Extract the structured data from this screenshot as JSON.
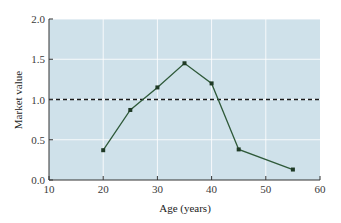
{
  "chart_data": {
    "type": "line",
    "title": "",
    "xlabel": "Age (years)",
    "ylabel": "Market value",
    "xlim": [
      10,
      60
    ],
    "ylim": [
      0,
      2.0
    ],
    "x_ticks": [
      "10",
      "20",
      "30",
      "40",
      "50",
      "60"
    ],
    "y_ticks": [
      "0.0",
      "0.5",
      "1.0",
      "1.5",
      "2.0"
    ],
    "grid": true,
    "legend": null,
    "series": [
      {
        "name": "Market value",
        "x": [
          20,
          25,
          30,
          35,
          40,
          45,
          55
        ],
        "y": [
          0.37,
          0.87,
          1.15,
          1.45,
          1.2,
          0.38,
          0.13
        ],
        "color": "#2f5a3a",
        "marker": "square"
      }
    ],
    "reference_lines": [
      {
        "orientation": "horizontal",
        "y": 1.0,
        "style": "dashed",
        "color": "#1a1a1a"
      }
    ],
    "background_color": "#cfe1ea"
  }
}
